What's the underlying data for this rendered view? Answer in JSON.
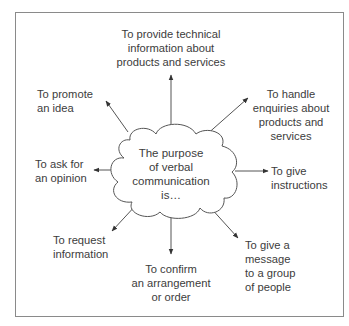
{
  "diagram": {
    "type": "mind-map",
    "center": {
      "text": "The purpose\nof verbal\ncommunication\nis…"
    },
    "branches": [
      {
        "id": "top",
        "direction": "up",
        "text": "To provide technical\ninformation about\nproducts and services"
      },
      {
        "id": "top-left",
        "direction": "up-left",
        "text": "To promote\nan idea"
      },
      {
        "id": "top-right",
        "direction": "up-right",
        "text": "To handle\nenquiries about\nproducts and\nservices"
      },
      {
        "id": "left",
        "direction": "left",
        "text": "To ask for\nan opinion"
      },
      {
        "id": "right",
        "direction": "right",
        "text": "To give\ninstructions"
      },
      {
        "id": "bottom-left",
        "direction": "down-left",
        "text": "To request\ninformation"
      },
      {
        "id": "bottom",
        "direction": "down",
        "text": "To confirm\nan arrangement\nor order"
      },
      {
        "id": "bottom-right",
        "direction": "down-right",
        "text": "To give a\nmessage\nto a group\nof people"
      }
    ],
    "colors": {
      "line": "#555555",
      "frame": "#8a8a8a",
      "text": "#3c3c3c",
      "background": "#ffffff"
    }
  }
}
